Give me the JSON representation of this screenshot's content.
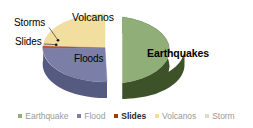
{
  "chart_data": {
    "type": "pie",
    "title": "",
    "subtitle": "",
    "xlabel": "",
    "ylabel": "",
    "style": "3d-exploded-pie",
    "legend_position": "bottom",
    "grid": false,
    "categories": [
      "Earthquake",
      "Flood",
      "Slides",
      "Volcanos",
      "Storm"
    ],
    "values": [
      50,
      22,
      2,
      25,
      1
    ],
    "slices": [
      {
        "name": "Earthquake",
        "slice_label": "Earthquakes",
        "value": 50,
        "color": "#8FAE78",
        "side_color": "#3E5229",
        "exploded": true,
        "label_placement": "inside",
        "label_bold": true
      },
      {
        "name": "Flood",
        "slice_label": "Floods",
        "value": 22,
        "color": "#7B7FA8",
        "side_color": "#555A80",
        "exploded": false,
        "label_placement": "inside",
        "label_bold": false
      },
      {
        "name": "Slides",
        "slice_label": "Slides",
        "value": 2,
        "color": "#C4501E",
        "side_color": "#8E3612",
        "exploded": false,
        "label_placement": "leader",
        "label_bold": false
      },
      {
        "name": "Volcanos",
        "slice_label": "Volcanos",
        "value": 25,
        "color": "#F2DFA0",
        "side_color": "#CDBA7C",
        "exploded": false,
        "label_placement": "inside",
        "label_bold": false
      },
      {
        "name": "Storm",
        "slice_label": "Storms",
        "value": 1,
        "color": "#E8E3C8",
        "side_color": "#BFBA9F",
        "exploded": false,
        "label_placement": "leader",
        "label_bold": false
      }
    ]
  },
  "slice_labels": {
    "earthquakes": "Earthquakes",
    "volcanos": "Volcanos",
    "floods": "Floods",
    "storms": "Storms",
    "slides": "Slides"
  },
  "legend": {
    "items": [
      {
        "label": "Earthquake",
        "color": "#8FAE78",
        "emphasized": false
      },
      {
        "label": "Flood",
        "color": "#7B7FA8",
        "emphasized": false
      },
      {
        "label": "Slides",
        "color": "#A33A12",
        "emphasized": true
      },
      {
        "label": "Volcanos",
        "color": "#F2DFA0",
        "emphasized": false
      },
      {
        "label": "Storm",
        "color": "#E0DCC4",
        "emphasized": false
      }
    ]
  },
  "colors": {
    "background": "#FFFFFF",
    "legend_text": "#9A9A9A",
    "legend_text_emphasized": "#2B2B2B",
    "label_text": "#000000",
    "leader_line": "#333333"
  }
}
